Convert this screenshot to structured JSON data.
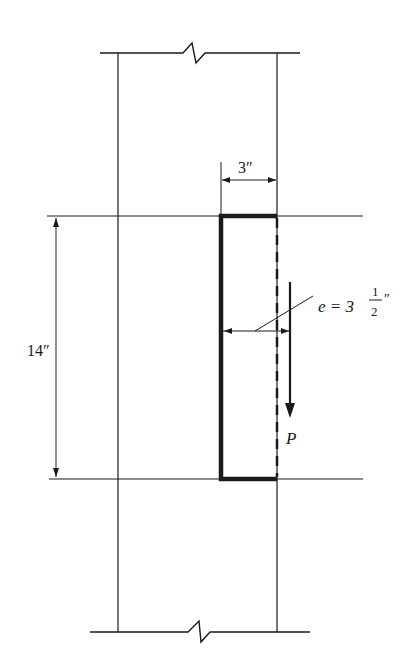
{
  "diagram": {
    "width_label": "3″",
    "height_label": "14″",
    "eccentricity": {
      "prefix": "e = 3",
      "fraction_num": "1",
      "fraction_den": "2",
      "unit": "″"
    },
    "load_label": "P",
    "colors": {
      "line": "#1a1a1a",
      "background": "#ffffff"
    }
  }
}
